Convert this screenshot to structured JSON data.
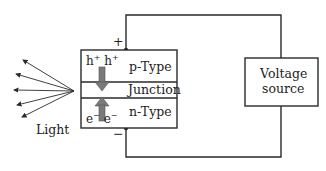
{
  "diagram": {
    "type": "led-circuit",
    "semiconductor": {
      "layers": [
        {
          "id": "p",
          "label": "p-Type",
          "carriers": [
            "h",
            "h"
          ],
          "carrier_charge": "+"
        },
        {
          "id": "junction",
          "label": "Junction"
        },
        {
          "id": "n",
          "label": "n-Type",
          "carriers": [
            "e",
            "e"
          ],
          "carrier_charge": "−"
        }
      ]
    },
    "terminals": {
      "positive": "+",
      "negative": "−"
    },
    "source": {
      "line1": "Voltage",
      "line2": "source"
    },
    "emission": {
      "label": "Light",
      "ray_count": 5
    },
    "colors": {
      "line": "#2a2a2a",
      "arrow_fill": "#7a7a7a",
      "background": "#ffffff"
    }
  }
}
